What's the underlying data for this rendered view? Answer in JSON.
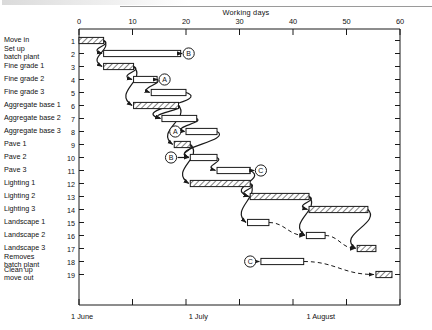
{
  "chart_data": {
    "type": "bar",
    "title": "Working days",
    "xlabel": "Working days",
    "ylabel": "",
    "xlim": [
      0,
      60
    ],
    "xticks": [
      0,
      10,
      20,
      30,
      40,
      50,
      60
    ],
    "grid": false,
    "legend": "none",
    "date_axis": {
      "labels": [
        "1 June",
        "1 July",
        "1 August"
      ],
      "positions_days": [
        0,
        22,
        44
      ]
    },
    "row_numbers": [
      1,
      2,
      3,
      4,
      5,
      6,
      7,
      8,
      9,
      10,
      11,
      12,
      13,
      14,
      15,
      16,
      17,
      18,
      19
    ],
    "categories": [
      "Move in",
      "Set up batch plant",
      "Fine grade 1",
      "Fine grade 2",
      "Fine grade 3",
      "Aggregate base 1",
      "Aggregate base 2",
      "Aggregate base 3",
      "Pave 1",
      "Pave 2",
      "Pave 3",
      "Lighting 1",
      "Lighting 2",
      "Lighting 3",
      "Landscape 1",
      "Landscape 2",
      "Landscape 3",
      "Removes batch plant",
      "Clean up move out"
    ],
    "bars": [
      {
        "row": 1,
        "label": "Move in",
        "start": 0,
        "end": 4.6,
        "critical": true,
        "float_end": null,
        "node": null
      },
      {
        "row": 2,
        "label": "Set up batch plant",
        "start": 4.6,
        "end": 19.0,
        "critical": false,
        "float_end": null,
        "node": "B"
      },
      {
        "row": 3,
        "label": "Fine grade 1",
        "start": 4.6,
        "end": 10.2,
        "critical": true,
        "float_end": null,
        "node": null
      },
      {
        "row": 4,
        "label": "Fine grade 2",
        "start": 10.2,
        "end": 14.6,
        "critical": false,
        "float_end": null,
        "node": "A"
      },
      {
        "row": 5,
        "label": "Fine grade 3",
        "start": 13.5,
        "end": 20.0,
        "critical": false,
        "float_end": null,
        "node": null
      },
      {
        "row": 6,
        "label": "Aggregate base 1",
        "start": 10.2,
        "end": 18.6,
        "critical": true,
        "float_end": null,
        "node": null
      },
      {
        "row": 7,
        "label": "Aggregate base 2",
        "start": 15.5,
        "end": 22.0,
        "critical": false,
        "float_end": null,
        "node": null
      },
      {
        "row": 8,
        "label": "Aggregate base 3",
        "start": 20.0,
        "end": 25.8,
        "critical": false,
        "float_end": null,
        "node": "A"
      },
      {
        "row": 9,
        "label": "Pave 1",
        "start": 17.8,
        "end": 20.8,
        "critical": true,
        "float_end": null,
        "node": null
      },
      {
        "row": 10,
        "label": "Pave 2",
        "start": 20.8,
        "end": 25.8,
        "critical": false,
        "float_end": null,
        "node": "B"
      },
      {
        "row": 11,
        "label": "Pave 3",
        "start": 25.8,
        "end": 32.0,
        "critical": false,
        "float_end": null,
        "node": "C"
      },
      {
        "row": 12,
        "label": "Lighting 1",
        "start": 20.8,
        "end": 32.0,
        "critical": true,
        "float_end": null,
        "node": null
      },
      {
        "row": 13,
        "label": "Lighting 2",
        "start": 32.0,
        "end": 43.0,
        "critical": true,
        "float_end": null,
        "node": null
      },
      {
        "row": 14,
        "label": "Lighting 3",
        "start": 43.0,
        "end": 54.0,
        "critical": true,
        "float_end": null,
        "node": null
      },
      {
        "row": 15,
        "label": "Landscape 1",
        "start": 31.5,
        "end": 35.5,
        "critical": false,
        "float_end": 42.5,
        "node": null
      },
      {
        "row": 16,
        "label": "Landscape 2",
        "start": 42.5,
        "end": 46.0,
        "critical": false,
        "float_end": 52.0,
        "node": null
      },
      {
        "row": 17,
        "label": "Landscape 3",
        "start": 52.0,
        "end": 55.5,
        "critical": true,
        "float_end": null,
        "node": null
      },
      {
        "row": 18,
        "label": "Removes batch plant",
        "start": 34.0,
        "end": 42.0,
        "critical": false,
        "float_end": 49.5,
        "node": "C"
      },
      {
        "row": 19,
        "label": "Clean up move out",
        "start": 55.5,
        "end": 58.5,
        "critical": true,
        "float_end": null,
        "node": null
      }
    ],
    "event_nodes": [
      {
        "id": "B",
        "row": 2,
        "day": 20.5
      },
      {
        "id": "A",
        "row": 4,
        "day": 16.0
      },
      {
        "id": "A",
        "row": 8,
        "day": 18.0
      },
      {
        "id": "B",
        "row": 10,
        "day": 17.2
      },
      {
        "id": "C",
        "row": 11,
        "day": 34.0
      },
      {
        "id": "C",
        "row": 18,
        "day": 32.0
      }
    ]
  },
  "colors": {
    "line": "#1a1a1a",
    "hatch": "#1a1a1a",
    "bar_fill": "#ffffff",
    "text": "#111111"
  }
}
